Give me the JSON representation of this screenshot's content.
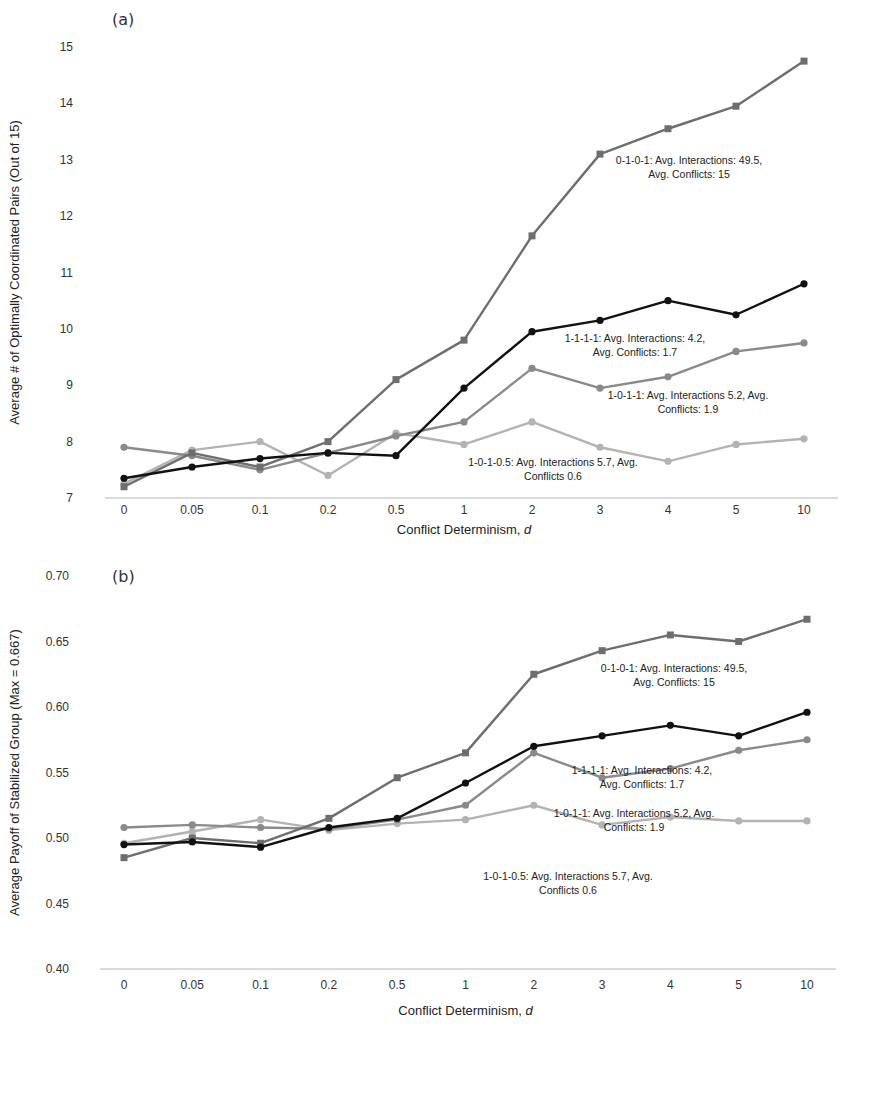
{
  "chart_data": [
    {
      "id": "a",
      "type": "line",
      "panel_label": "(a)",
      "title": "",
      "xlabel": "Conflict Determinism, d",
      "xlabel_main": "Conflict Determinism, ",
      "xlabel_var": "d",
      "ylabel": "Average # of Optimally Coordinated Pairs (Out of 15)",
      "ylim": [
        7,
        15
      ],
      "yticks": [
        7,
        8,
        9,
        10,
        11,
        12,
        13,
        14,
        15
      ],
      "ytick_labels": [
        "7",
        "8",
        "9",
        "10",
        "11",
        "12",
        "13",
        "14",
        "15"
      ],
      "grid": false,
      "legend": "none (inline annotations)",
      "categories": [
        "0",
        "0.05",
        "0.1",
        "0.2",
        "0.5",
        "1",
        "2",
        "3",
        "4",
        "5",
        "10"
      ],
      "series": [
        {
          "name": "0-1-0-1",
          "color": "#6e6e6e",
          "marker": "square",
          "values": [
            7.2,
            7.8,
            7.55,
            8.0,
            9.1,
            9.8,
            11.65,
            13.1,
            13.55,
            13.95,
            14.75
          ]
        },
        {
          "name": "1-1-1-1",
          "color": "#111111",
          "marker": "circle",
          "values": [
            7.35,
            7.55,
            7.7,
            7.8,
            7.75,
            8.95,
            9.95,
            10.15,
            10.5,
            10.25,
            10.8
          ]
        },
        {
          "name": "1-0-1-1",
          "color": "#8a8a8a",
          "marker": "circle",
          "values": [
            7.9,
            7.75,
            7.5,
            7.8,
            8.1,
            8.35,
            9.3,
            8.95,
            9.15,
            9.6,
            9.75
          ]
        },
        {
          "name": "1-0-1-0.5",
          "color": "#b3b3b3",
          "marker": "circle",
          "values": [
            7.25,
            7.85,
            8.0,
            7.4,
            8.15,
            7.95,
            8.35,
            7.9,
            7.65,
            7.95,
            8.05
          ]
        }
      ],
      "annotations": [
        {
          "lines": [
            "0-1-0-1: Avg. Interactions: 49.5,",
            "Avg. Conflicts: 15"
          ],
          "x": 689,
          "y": 164
        },
        {
          "lines": [
            "1-1-1-1: Avg. Interactions: 4.2,",
            "Avg. Conflicts: 1.7"
          ],
          "x": 635,
          "y": 342
        },
        {
          "lines": [
            "1-0-1-1: Avg. Interactions 5.2, Avg.",
            "Conflicts: 1.9"
          ],
          "x": 688,
          "y": 399
        },
        {
          "lines": [
            "1-0-1-0.5: Avg. Interactions 5.7, Avg.",
            "Conflicts 0.6"
          ],
          "x": 553,
          "y": 466
        }
      ]
    },
    {
      "id": "b",
      "type": "line",
      "panel_label": "(b)",
      "title": "",
      "xlabel": "Conflict Determinism, d",
      "xlabel_main": "Conflict Determinism, ",
      "xlabel_var": "d",
      "ylabel": "Average Payoff of Stabilized Group (Max = 0.667)",
      "ylim": [
        0.4,
        0.7
      ],
      "yticks": [
        0.4,
        0.45,
        0.5,
        0.55,
        0.6,
        0.65,
        0.7
      ],
      "ytick_labels": [
        "0.40",
        "0.45",
        "0.50",
        "0.55",
        "0.60",
        "0.65",
        "0.70"
      ],
      "grid": false,
      "legend": "none (inline annotations)",
      "categories": [
        "0",
        "0.05",
        "0.1",
        "0.2",
        "0.5",
        "1",
        "2",
        "3",
        "4",
        "5",
        "10"
      ],
      "series": [
        {
          "name": "0-1-0-1",
          "color": "#6e6e6e",
          "marker": "square",
          "values": [
            0.485,
            0.5,
            0.496,
            0.515,
            0.546,
            0.565,
            0.625,
            0.643,
            0.655,
            0.65,
            0.667
          ]
        },
        {
          "name": "1-1-1-1",
          "color": "#111111",
          "marker": "circle",
          "values": [
            0.495,
            0.497,
            0.493,
            0.508,
            0.515,
            0.542,
            0.57,
            0.578,
            0.586,
            0.578,
            0.596
          ]
        },
        {
          "name": "1-0-1-1",
          "color": "#8a8a8a",
          "marker": "circle",
          "values": [
            0.508,
            0.51,
            0.508,
            0.507,
            0.514,
            0.525,
            0.565,
            0.546,
            0.553,
            0.567,
            0.575
          ]
        },
        {
          "name": "1-0-1-0.5",
          "color": "#b3b3b3",
          "marker": "circle",
          "values": [
            0.496,
            0.505,
            0.514,
            0.506,
            0.511,
            0.514,
            0.525,
            0.51,
            0.516,
            0.513,
            0.513
          ]
        }
      ],
      "annotations": [
        {
          "lines": [
            "0-1-0-1: Avg. Interactions: 49.5,",
            "Avg. Conflicts: 15"
          ],
          "x": 674,
          "y": 117
        },
        {
          "lines": [
            "1-1-1-1: Avg. Interactions: 4.2,",
            "Avg. Conflicts: 1.7"
          ],
          "x": 642,
          "y": 219
        },
        {
          "lines": [
            "1-0-1-1: Avg. Interactions 5.2, Avg.",
            "Conflicts: 1.9"
          ],
          "x": 634,
          "y": 262
        },
        {
          "lines": [
            "1-0-1-0.5: Avg. Interactions 5.7, Avg.",
            "Conflicts 0.6"
          ],
          "x": 568,
          "y": 325
        }
      ]
    }
  ]
}
